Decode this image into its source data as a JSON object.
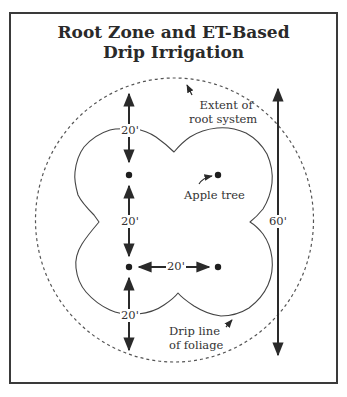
{
  "figure": {
    "title_line1": "Root Zone and ET-Based",
    "title_line2": "Drip Irrigation",
    "labels": {
      "root_extent_line1": "Extent of",
      "root_extent_line2": "root system",
      "apple_tree": "Apple tree",
      "drip_line_line1": "Drip line",
      "drip_line_line2": "of foliage"
    },
    "dimensions": {
      "top_spacing": "20'",
      "middle_vertical_spacing": "20'",
      "horizontal_spacing": "20'",
      "bottom_spacing": "20'",
      "overall_height": "60'"
    },
    "trees": [
      {
        "x": 129,
        "y": 175
      },
      {
        "x": 218,
        "y": 175
      },
      {
        "x": 129,
        "y": 267
      },
      {
        "x": 218,
        "y": 267
      }
    ],
    "caption": "Figure ..."
  }
}
